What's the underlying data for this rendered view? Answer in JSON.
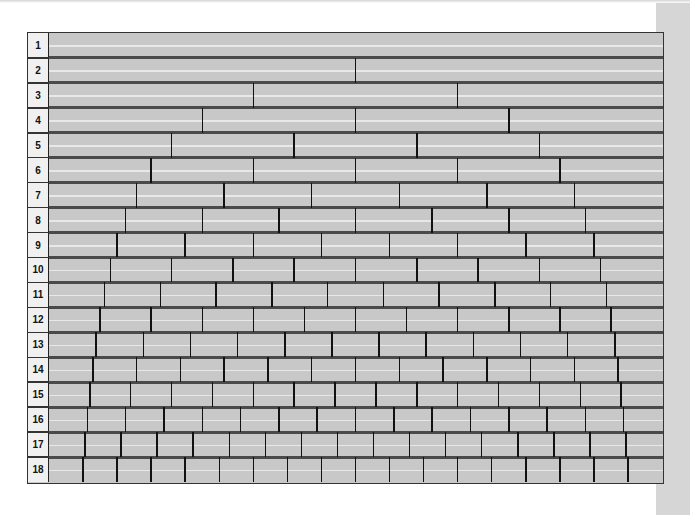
{
  "chart_data": {
    "type": "table",
    "title": "",
    "rows": [
      {
        "label": "1",
        "parts": 1
      },
      {
        "label": "2",
        "parts": 2
      },
      {
        "label": "3",
        "parts": 3
      },
      {
        "label": "4",
        "parts": 4
      },
      {
        "label": "5",
        "parts": 5
      },
      {
        "label": "6",
        "parts": 6
      },
      {
        "label": "7",
        "parts": 7
      },
      {
        "label": "8",
        "parts": 8
      },
      {
        "label": "9",
        "parts": 9
      },
      {
        "label": "10",
        "parts": 10
      },
      {
        "label": "11",
        "parts": 11
      },
      {
        "label": "12",
        "parts": 12
      },
      {
        "label": "13",
        "parts": 13
      },
      {
        "label": "14",
        "parts": 14
      },
      {
        "label": "15",
        "parts": 15
      },
      {
        "label": "16",
        "parts": 16
      },
      {
        "label": "17",
        "parts": 17
      },
      {
        "label": "18",
        "parts": 18
      }
    ]
  },
  "colors": {
    "bar": "#c8c8c8",
    "highlight": "#e8e8e8",
    "label_bg": "#f0f0f0",
    "row_separator": "#4a4a4a",
    "divider": "#111111",
    "side_band": "#d6d6d6"
  }
}
